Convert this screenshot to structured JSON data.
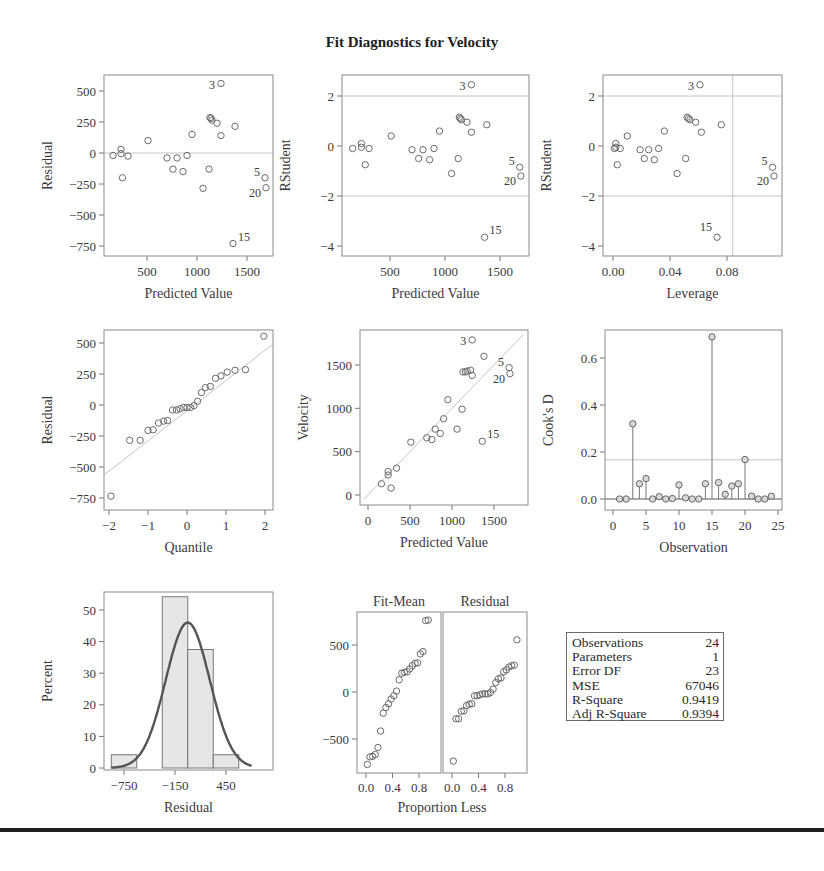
{
  "title": "Fit Diagnostics for Velocity",
  "chart_data": [
    {
      "id": "residual_vs_predicted",
      "type": "scatter",
      "xlabel": "Predicted Value",
      "ylabel": "Residual",
      "xticks": [
        500,
        1000,
        1500
      ],
      "yticks": [
        500,
        250,
        0,
        -250,
        -500,
        -750
      ],
      "reference_lines": {
        "y": [
          0
        ]
      },
      "points": [
        [
          160,
          -20
        ],
        [
          240,
          30
        ],
        [
          240,
          -5
        ],
        [
          255,
          -200
        ],
        [
          310,
          -25
        ],
        [
          510,
          100
        ],
        [
          700,
          -40
        ],
        [
          760,
          -130
        ],
        [
          800,
          -40
        ],
        [
          860,
          -150
        ],
        [
          900,
          -20
        ],
        [
          950,
          150
        ],
        [
          1060,
          -285
        ],
        [
          1120,
          -130
        ],
        [
          1130,
          285
        ],
        [
          1140,
          280
        ],
        [
          1150,
          265
        ],
        [
          1200,
          240
        ],
        [
          1240,
          560
        ],
        [
          1240,
          140
        ],
        [
          1380,
          215
        ],
        [
          1680,
          -200
        ],
        [
          1690,
          -280
        ],
        [
          1360,
          -730
        ]
      ],
      "labels": [
        {
          "text": "3",
          "x": 1240,
          "y": 560
        },
        {
          "text": "5",
          "x": 1680,
          "y": -200
        },
        {
          "text": "20",
          "x": 1690,
          "y": -280
        },
        {
          "text": "15",
          "x": 1360,
          "y": -730
        }
      ]
    },
    {
      "id": "rstudent_vs_predicted",
      "type": "scatter",
      "xlabel": "Predicted Value",
      "ylabel": "RStudent",
      "xticks": [
        500,
        1000,
        1500
      ],
      "yticks": [
        2,
        0,
        -2,
        -4
      ],
      "reference_lines": {
        "y": [
          2,
          -2
        ]
      },
      "points": [
        [
          160,
          -0.1
        ],
        [
          240,
          0.1
        ],
        [
          240,
          -0.05
        ],
        [
          275,
          -0.75
        ],
        [
          310,
          -0.1
        ],
        [
          510,
          0.4
        ],
        [
          700,
          -0.15
        ],
        [
          760,
          -0.5
        ],
        [
          800,
          -0.15
        ],
        [
          860,
          -0.55
        ],
        [
          900,
          -0.1
        ],
        [
          950,
          0.6
        ],
        [
          1060,
          -1.1
        ],
        [
          1120,
          -0.5
        ],
        [
          1130,
          1.15
        ],
        [
          1140,
          1.1
        ],
        [
          1150,
          1.05
        ],
        [
          1200,
          0.95
        ],
        [
          1240,
          2.45
        ],
        [
          1240,
          0.55
        ],
        [
          1380,
          0.85
        ],
        [
          1680,
          -0.85
        ],
        [
          1690,
          -1.2
        ],
        [
          1360,
          -3.65
        ]
      ],
      "labels": [
        {
          "text": "3",
          "x": 1240,
          "y": 2.45
        },
        {
          "text": "5",
          "x": 1680,
          "y": -0.85
        },
        {
          "text": "20",
          "x": 1690,
          "y": -1.2
        },
        {
          "text": "15",
          "x": 1360,
          "y": -3.65
        }
      ]
    },
    {
      "id": "rstudent_vs_leverage",
      "type": "scatter",
      "xlabel": "Leverage",
      "ylabel": "RStudent",
      "xticks": [
        0.0,
        0.04,
        0.08
      ],
      "yticks": [
        2,
        0,
        -2,
        -4
      ],
      "reference_lines": {
        "y": [
          2,
          -2
        ],
        "x": [
          0.084
        ]
      },
      "points": [
        [
          0.001,
          -0.1
        ],
        [
          0.002,
          0.1
        ],
        [
          0.002,
          -0.05
        ],
        [
          0.003,
          -0.75
        ],
        [
          0.005,
          -0.1
        ],
        [
          0.01,
          0.4
        ],
        [
          0.019,
          -0.15
        ],
        [
          0.022,
          -0.5
        ],
        [
          0.025,
          -0.15
        ],
        [
          0.029,
          -0.55
        ],
        [
          0.032,
          -0.1
        ],
        [
          0.036,
          0.6
        ],
        [
          0.045,
          -1.1
        ],
        [
          0.051,
          -0.5
        ],
        [
          0.052,
          1.15
        ],
        [
          0.053,
          1.1
        ],
        [
          0.054,
          1.05
        ],
        [
          0.058,
          0.95
        ],
        [
          0.061,
          2.45
        ],
        [
          0.062,
          0.55
        ],
        [
          0.076,
          0.85
        ],
        [
          0.112,
          -0.85
        ],
        [
          0.113,
          -1.2
        ],
        [
          0.073,
          -3.65
        ]
      ],
      "labels": [
        {
          "text": "3",
          "x": 0.061,
          "y": 2.45
        },
        {
          "text": "5",
          "x": 0.112,
          "y": -0.85
        },
        {
          "text": "20",
          "x": 0.113,
          "y": -1.2
        },
        {
          "text": "15",
          "x": 0.073,
          "y": -3.65
        }
      ]
    },
    {
      "id": "residual_qq",
      "type": "scatter",
      "xlabel": "Quantile",
      "ylabel": "Residual",
      "xticks": [
        -2,
        -1,
        0,
        1,
        2
      ],
      "yticks": [
        500,
        250,
        0,
        -250,
        -500,
        -750
      ],
      "reference_line": {
        "x0": -2.15,
        "y0": -570,
        "x1": 2.2,
        "y1": 490
      },
      "points": [
        [
          -1.95,
          -735
        ],
        [
          -1.47,
          -285
        ],
        [
          -1.2,
          -285
        ],
        [
          -1.0,
          -205
        ],
        [
          -0.87,
          -200
        ],
        [
          -0.73,
          -145
        ],
        [
          -0.6,
          -130
        ],
        [
          -0.5,
          -125
        ],
        [
          -0.37,
          -40
        ],
        [
          -0.27,
          -40
        ],
        [
          -0.18,
          -30
        ],
        [
          -0.09,
          -20
        ],
        [
          0.0,
          -20
        ],
        [
          0.09,
          -20
        ],
        [
          0.18,
          -5
        ],
        [
          0.27,
          30
        ],
        [
          0.37,
          100
        ],
        [
          0.47,
          140
        ],
        [
          0.6,
          150
        ],
        [
          0.73,
          215
        ],
        [
          0.87,
          235
        ],
        [
          1.03,
          265
        ],
        [
          1.23,
          280
        ],
        [
          1.5,
          285
        ],
        [
          1.97,
          555
        ]
      ]
    },
    {
      "id": "observed_vs_predicted",
      "type": "scatter",
      "xlabel": "Predicted Value",
      "ylabel": "Velocity",
      "xticks": [
        0,
        500,
        1000,
        1500
      ],
      "yticks": [
        0,
        500,
        1000,
        1500
      ],
      "reference_line": {
        "x0": -50,
        "y0": -50,
        "x1": 1850,
        "y1": 1850
      },
      "points": [
        [
          160,
          130
        ],
        [
          240,
          270
        ],
        [
          240,
          230
        ],
        [
          275,
          80
        ],
        [
          340,
          310
        ],
        [
          510,
          610
        ],
        [
          700,
          660
        ],
        [
          760,
          640
        ],
        [
          800,
          760
        ],
        [
          860,
          710
        ],
        [
          900,
          880
        ],
        [
          950,
          1100
        ],
        [
          1060,
          760
        ],
        [
          1120,
          990
        ],
        [
          1130,
          1420
        ],
        [
          1160,
          1420
        ],
        [
          1180,
          1430
        ],
        [
          1220,
          1440
        ],
        [
          1240,
          1790
        ],
        [
          1240,
          1380
        ],
        [
          1380,
          1600
        ],
        [
          1680,
          1470
        ],
        [
          1690,
          1400
        ],
        [
          1360,
          620
        ]
      ],
      "labels": [
        {
          "text": "3",
          "x": 1240,
          "y": 1790
        },
        {
          "text": "5",
          "x": 1680,
          "y": 1470
        },
        {
          "text": "20",
          "x": 1690,
          "y": 1400
        },
        {
          "text": "15",
          "x": 1360,
          "y": 620
        }
      ]
    },
    {
      "id": "cooks_d",
      "type": "bar",
      "xlabel": "Observation",
      "ylabel": "Cook's D",
      "xticks": [
        0,
        5,
        10,
        15,
        20,
        25
      ],
      "yticks": [
        0.0,
        0.2,
        0.4,
        0.6
      ],
      "reference_lines": {
        "y": [
          0.0,
          0.167
        ]
      },
      "categories": [
        1,
        2,
        3,
        4,
        5,
        6,
        7,
        8,
        9,
        10,
        11,
        12,
        13,
        14,
        15,
        16,
        17,
        18,
        19,
        20,
        21,
        22,
        23,
        24
      ],
      "values": [
        0.0,
        0.0,
        0.32,
        0.065,
        0.087,
        0.0,
        0.01,
        0.0,
        0.002,
        0.06,
        0.005,
        0.0,
        0.0,
        0.065,
        0.69,
        0.07,
        0.02,
        0.055,
        0.065,
        0.168,
        0.012,
        0.0,
        0.0,
        0.012
      ]
    },
    {
      "id": "residual_histogram",
      "type": "bar",
      "xlabel": "Residual",
      "ylabel": "Percent",
      "xticks": [
        -750,
        -150,
        450
      ],
      "yticks": [
        0,
        10,
        20,
        30,
        40,
        50
      ],
      "bins": [
        {
          "x0": -900,
          "x1": -600,
          "percent": 4.2
        },
        {
          "x0": -600,
          "x1": -300,
          "percent": 0
        },
        {
          "x0": -300,
          "x1": 0,
          "percent": 54.2
        },
        {
          "x0": 0,
          "x1": 300,
          "percent": 37.5
        },
        {
          "x0": 300,
          "x1": 600,
          "percent": 4.2
        }
      ],
      "normal_curve": {
        "mean": 0,
        "sd": 259,
        "peak_percent": 46
      }
    },
    {
      "id": "residual_fit_spread",
      "type": "scatter",
      "xlabel": "Proportion Less",
      "ylabel": "",
      "panels": [
        {
          "title": "Fit-Mean",
          "xticks": [
            0.0,
            0.4,
            0.8
          ],
          "points": [
            [
              0.02,
              -770
            ],
            [
              0.06,
              -690
            ],
            [
              0.1,
              -685
            ],
            [
              0.14,
              -665
            ],
            [
              0.18,
              -590
            ],
            [
              0.22,
              -415
            ],
            [
              0.26,
              -225
            ],
            [
              0.3,
              -165
            ],
            [
              0.34,
              -125
            ],
            [
              0.38,
              -75
            ],
            [
              0.42,
              -40
            ],
            [
              0.46,
              10
            ],
            [
              0.5,
              130
            ],
            [
              0.54,
              200
            ],
            [
              0.58,
              210
            ],
            [
              0.62,
              215
            ],
            [
              0.66,
              245
            ],
            [
              0.7,
              280
            ],
            [
              0.74,
              305
            ],
            [
              0.78,
              310
            ],
            [
              0.82,
              405
            ],
            [
              0.86,
              430
            ],
            [
              0.9,
              760
            ],
            [
              0.94,
              765
            ]
          ]
        },
        {
          "title": "Residual",
          "xticks": [
            0.0,
            0.4,
            0.8
          ],
          "points": [
            [
              0.02,
              -735
            ],
            [
              0.06,
              -285
            ],
            [
              0.1,
              -285
            ],
            [
              0.14,
              -205
            ],
            [
              0.18,
              -200
            ],
            [
              0.22,
              -145
            ],
            [
              0.26,
              -130
            ],
            [
              0.3,
              -125
            ],
            [
              0.34,
              -40
            ],
            [
              0.38,
              -40
            ],
            [
              0.42,
              -30
            ],
            [
              0.46,
              -20
            ],
            [
              0.5,
              -20
            ],
            [
              0.54,
              -20
            ],
            [
              0.58,
              -5
            ],
            [
              0.62,
              30
            ],
            [
              0.66,
              100
            ],
            [
              0.7,
              140
            ],
            [
              0.74,
              150
            ],
            [
              0.78,
              215
            ],
            [
              0.82,
              235
            ],
            [
              0.86,
              265
            ],
            [
              0.9,
              280
            ],
            [
              0.94,
              285
            ],
            [
              0.98,
              555
            ]
          ]
        }
      ],
      "yticks": [
        500,
        0,
        -500
      ]
    }
  ],
  "stats": {
    "rows": [
      {
        "label": "Observations",
        "value": "24"
      },
      {
        "label": "Parameters",
        "value": "1"
      },
      {
        "label": "Error DF",
        "value": "23"
      },
      {
        "label": "MSE",
        "value": "67046"
      },
      {
        "label": "R-Square",
        "value": "0.9419"
      },
      {
        "label": "Adj R-Square",
        "value": "0.9394"
      }
    ]
  }
}
